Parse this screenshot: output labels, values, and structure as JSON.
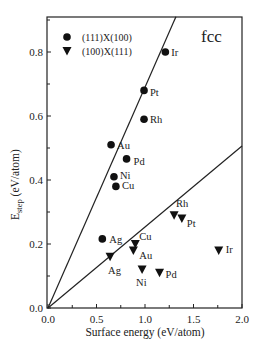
{
  "chart_data": {
    "type": "scatter",
    "title": "",
    "annotation": "fcc",
    "xlabel": "Surface energy (eV/atom)",
    "ylabel_main": "E",
    "ylabel_sub": "step",
    "ylabel_units": " (eV/atom)",
    "xlim": [
      0.0,
      2.0
    ],
    "ylim": [
      0.0,
      0.9
    ],
    "xticks": [
      0.0,
      0.5,
      1.0,
      1.5,
      2.0
    ],
    "xtick_labels": [
      "0.0",
      "0.5",
      "1.0",
      "1.5",
      "2.0"
    ],
    "xminor_step": 0.25,
    "yticks": [
      0.0,
      0.2,
      0.4,
      0.6,
      0.8
    ],
    "ytick_labels": [
      "0.0",
      "0.2",
      "0.4",
      "0.6",
      "0.8"
    ],
    "yminor_step": 0.1,
    "grid": false,
    "legend_position": "upper left",
    "series": [
      {
        "name": "(111)X(100)",
        "marker": "circle",
        "points": [
          {
            "label": "Ir",
            "x": 1.21,
            "y": 0.8,
            "dx": 6,
            "dy": 4
          },
          {
            "label": "Pt",
            "x": 0.99,
            "y": 0.68,
            "dx": 6,
            "dy": 6
          },
          {
            "label": "Rh",
            "x": 0.99,
            "y": 0.59,
            "dx": 6,
            "dy": 4
          },
          {
            "label": "Au",
            "x": 0.65,
            "y": 0.51,
            "dx": 6,
            "dy": 4
          },
          {
            "label": "Pd",
            "x": 0.81,
            "y": 0.466,
            "dx": 7,
            "dy": 6
          },
          {
            "label": "Ni",
            "x": 0.68,
            "y": 0.41,
            "dx": 6,
            "dy": 2
          },
          {
            "label": "Cu",
            "x": 0.7,
            "y": 0.38,
            "dx": 6,
            "dy": 3
          },
          {
            "label": "Ag",
            "x": 0.56,
            "y": 0.216,
            "dx": 7,
            "dy": 4
          }
        ],
        "fit_line": {
          "slope": 0.69,
          "intercept": 0.0
        }
      },
      {
        "name": "(100)X(111)",
        "marker": "triangle-down",
        "points": [
          {
            "label": "Rh",
            "x": 1.3,
            "y": 0.29,
            "dx": 2,
            "dy": -8
          },
          {
            "label": "Pt",
            "x": 1.38,
            "y": 0.28,
            "dx": 5,
            "dy": 9
          },
          {
            "label": "Ir",
            "x": 1.76,
            "y": 0.18,
            "dx": 7,
            "dy": 3
          },
          {
            "label": "Cu",
            "x": 0.9,
            "y": 0.2,
            "dx": 4,
            "dy": -4
          },
          {
            "label": "Au",
            "x": 0.88,
            "y": 0.18,
            "dx": 6,
            "dy": 9
          },
          {
            "label": "Ag",
            "x": 0.64,
            "y": 0.16,
            "dx": -2,
            "dy": 17
          },
          {
            "label": "Ni",
            "x": 0.97,
            "y": 0.12,
            "dx": -6,
            "dy": 16
          },
          {
            "label": "Pd",
            "x": 1.15,
            "y": 0.11,
            "dx": 6,
            "dy": 5
          }
        ],
        "fit_line": {
          "slope": 0.253,
          "intercept": 0.0
        }
      }
    ],
    "colors": {
      "marker": "#111111",
      "line": "#222222",
      "frame": "#222222"
    }
  }
}
